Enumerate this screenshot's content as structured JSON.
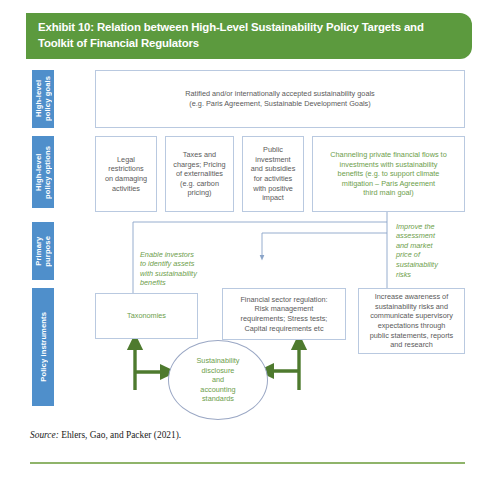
{
  "header": {
    "title": "Exhibit 10: Relation between High-Level Sustainability Policy Targets and Toolkit of Financial Regulators"
  },
  "colors": {
    "header_green": "#5c9a3e",
    "band_blue": "#4f8fcb",
    "text_green": "#6d9e4b",
    "text_grey": "#5a5a5a",
    "box_border": "#b9c9e0",
    "arrow_green": "#4e7a2e",
    "connector_blue": "#8aa4c8"
  },
  "bands": [
    {
      "label": "High-level\npolicy goals"
    },
    {
      "label": "High-level\npolicy options"
    },
    {
      "label": "Primary\npurpose"
    },
    {
      "label": "Policy instruments"
    }
  ],
  "goals": {
    "text": "Ratified and/or internationally accepted sustainability goals\n(e.g. Paris Agreement, Sustainable Development Goals)"
  },
  "options": [
    {
      "text": "Legal\nrestrictions\non damaging\nactivities"
    },
    {
      "text": "Taxes and\ncharges; Pricing\nof externalities\n(e.g. carbon\npricing)"
    },
    {
      "text": "Public\ninvestment\nand subsidies\nfor activities\nwith positive\nimpact"
    },
    {
      "text": "Channeling private financial flows to\ninvestments with sustainability\nbenefits (e.g. to support climate\nmitigation – Paris Agreement\nthird main goal)"
    }
  ],
  "purposes": [
    {
      "text": "Enable investors\nto identify assets\nwith sustainability\nbenefits"
    },
    {
      "text": "Improve the\nassessment\nand market\nprice of\nsustainability\nrisks"
    }
  ],
  "instruments": [
    {
      "text": "Taxonomies"
    },
    {
      "text": "Financial sector regulation:\nRisk management\nrequirements; Stress tests;\nCapital requirements etc"
    },
    {
      "text": "Increase awareness of\nsustainability risks and\ncommunicate supervisory\nexpectations through\npublic statements, reports\nand research"
    }
  ],
  "circle": {
    "text": "Sustainability\ndisclosure\nand\naccounting\nstandards"
  },
  "source": {
    "label": "Source:",
    "text": " Ehlers, Gao, and Packer (2021)."
  }
}
